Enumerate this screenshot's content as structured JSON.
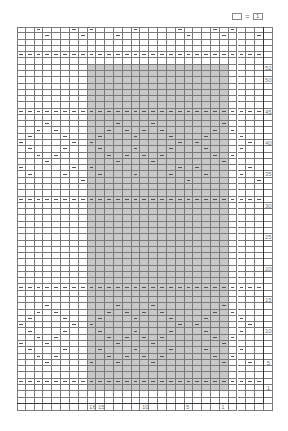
{
  "legend": {
    "blank_symbol": "",
    "equals": "=",
    "meaning": "1"
  },
  "chart": {
    "columns": 28,
    "pattern_rows": 58,
    "extra_rows_below": 2,
    "cell_width": 8.82,
    "cell_height": 6.28,
    "shade_color": "#c8c8c8",
    "shade_cols": [
      8,
      23
    ],
    "shade_rows": [
      1,
      52
    ],
    "full_dash_rows": [
      2,
      17,
      31,
      45,
      54
    ],
    "row_labels": [
      {
        "row": 1,
        "label": "1"
      },
      {
        "row": 5,
        "label": "5"
      },
      {
        "row": 10,
        "label": "10"
      },
      {
        "row": 15,
        "label": "15"
      },
      {
        "row": 20,
        "label": "20"
      },
      {
        "row": 25,
        "label": "25"
      },
      {
        "row": 30,
        "label": "30"
      },
      {
        "row": 35,
        "label": "35"
      },
      {
        "row": 40,
        "label": "40"
      },
      {
        "row": 45,
        "label": "45"
      },
      {
        "row": 50,
        "label": "50"
      },
      {
        "row": 52,
        "label": "52"
      }
    ],
    "col_labels": [
      {
        "col": 8,
        "label": "16"
      },
      {
        "col": 9,
        "label": "15"
      },
      {
        "col": 14,
        "label": "10"
      },
      {
        "col": 19,
        "label": "5"
      },
      {
        "col": 23,
        "label": "1"
      }
    ],
    "dashes": {
      "58": [
        2,
        6,
        8,
        13,
        18,
        22,
        24
      ],
      "57": [
        3,
        7,
        11,
        19,
        23,
        27
      ],
      "44": [],
      "43": [
        3,
        11,
        15,
        23
      ],
      "42": [
        2,
        4,
        10,
        12,
        14,
        16,
        22,
        24
      ],
      "41": [
        1,
        5,
        9,
        13,
        17,
        21,
        25
      ],
      "40": [
        0,
        6,
        8,
        18,
        20,
        26
      ],
      "39": [
        1,
        5,
        9,
        13,
        17,
        21,
        25
      ],
      "38": [
        2,
        4,
        10,
        12,
        14,
        16,
        22,
        24
      ],
      "37": [
        3,
        11,
        15,
        23
      ],
      "36": [
        0,
        6,
        8,
        18,
        20,
        26
      ],
      "35": [
        1,
        5,
        9,
        13,
        17,
        21,
        25
      ],
      "34": [
        7,
        19,
        27
      ],
      "14": [
        3,
        11,
        15,
        23
      ],
      "13": [
        2,
        4,
        10,
        12,
        14,
        16,
        22,
        24
      ],
      "12": [
        1,
        5,
        9,
        13,
        17,
        21,
        25
      ],
      "11": [
        0,
        6,
        8,
        18,
        20,
        26
      ],
      "10": [
        1,
        5,
        9,
        13,
        17,
        21,
        25
      ],
      "9": [
        2,
        4,
        10,
        12,
        14,
        16,
        22,
        24
      ],
      "8": [
        0,
        3,
        11,
        15,
        23
      ],
      "7": [
        1,
        5,
        9,
        13,
        17,
        21,
        25
      ],
      "6": [
        2,
        4,
        10,
        12,
        14,
        16,
        22,
        24
      ],
      "5": [
        3,
        8,
        11,
        15,
        23,
        26
      ]
    }
  }
}
